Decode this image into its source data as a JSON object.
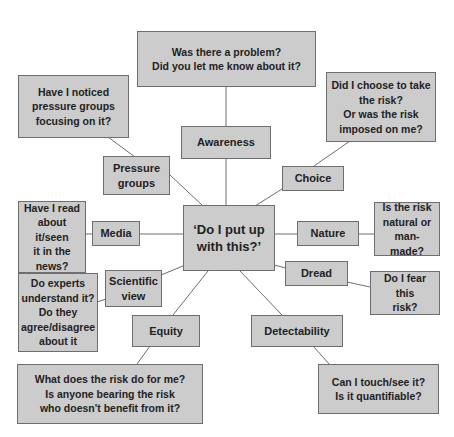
{
  "colors": {
    "box_fill": "#cccccc",
    "box_border": "#6e6e6e",
    "line": "#6e6e6e",
    "text": "#222222"
  },
  "center": {
    "label": "‘Do I put up\nwith this?’"
  },
  "categories": {
    "awareness": "Awareness",
    "choice": "Choice",
    "pressure_groups": "Pressure\ngroups",
    "media": "Media",
    "nature": "Nature",
    "scientific_view": "Scientific\nview",
    "dread": "Dread",
    "equity": "Equity",
    "detectability": "Detectability"
  },
  "questions": {
    "awareness": "Was there a problem?\nDid you let me know about it?",
    "choice": "Did I choose to take\nthe risk?\nOr was the risk\nimposed on me?",
    "pressure_groups": "Have I noticed\npressure groups\nfocusing on it?",
    "media": "Have I read\nabout it/seen\nit in the\nnews?",
    "nature": "Is the risk\nnatural or\nman-made?",
    "scientific_view": "Do experts\nunderstand it?\nDo they\nagree/disagree\nabout it",
    "dread": "Do I fear this\nrisk?",
    "equity": "What does the risk do for me?\nIs anyone bearing the risk\nwho doesn't benefit from it?",
    "detectability": "Can I touch/see it?\nIs it quantifiable?"
  }
}
